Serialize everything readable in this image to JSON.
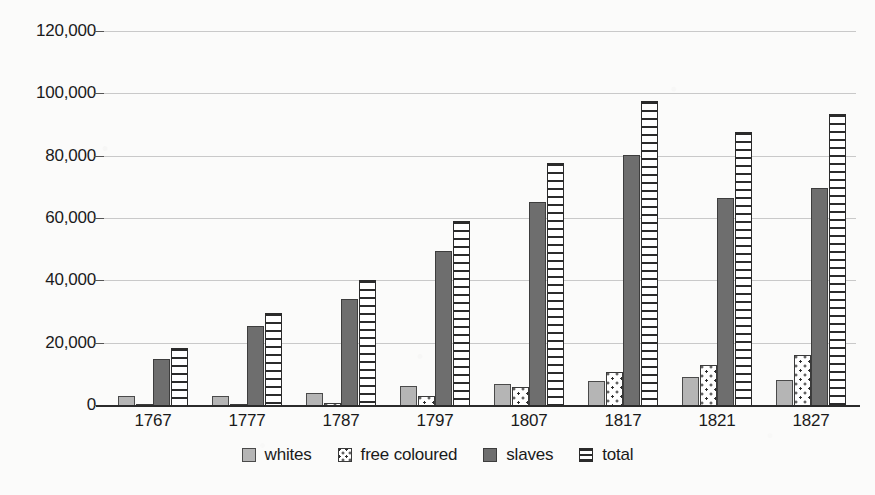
{
  "chart_data": {
    "type": "bar",
    "title": "",
    "subtitle": "",
    "xlabel": "",
    "ylabel": "",
    "ylim": [
      0,
      120000
    ],
    "yticks": [
      0,
      20000,
      40000,
      60000,
      80000,
      100000,
      120000
    ],
    "ytick_labels": [
      "0",
      "20,000",
      "40,000",
      "60,000",
      "80,000",
      "100,000",
      "120,000"
    ],
    "grid": true,
    "legend_position": "bottom",
    "categories": [
      "1767",
      "1777",
      "1787",
      "1797",
      "1807",
      "1817",
      "1821",
      "1827"
    ],
    "series": [
      {
        "name": "whites",
        "pattern": "solid-light-gray",
        "color": "#b5b5b5",
        "values": [
          3100,
          3300,
          4300,
          6500,
          7000,
          8000,
          9200,
          8400
        ]
      },
      {
        "name": "free coloured",
        "pattern": "white-dotted",
        "color": "#ffffff",
        "values": [
          500,
          800,
          1100,
          3300,
          6000,
          11000,
          13300,
          16300
        ]
      },
      {
        "name": "slaves",
        "pattern": "solid-dark-gray",
        "color": "#6e6e6e",
        "values": [
          15000,
          25600,
          34200,
          49600,
          65600,
          80400,
          66600,
          69800
        ]
      },
      {
        "name": "total",
        "pattern": "white-horizontal-stripes",
        "color": "#ffffff",
        "values": [
          18600,
          29700,
          40500,
          59400,
          78000,
          98000,
          88000,
          93600
        ]
      }
    ]
  },
  "legend": {
    "items": [
      {
        "label": "whites",
        "swatch": "swatch-whites"
      },
      {
        "label": "free coloured",
        "swatch": "swatch-free-coloured"
      },
      {
        "label": "slaves",
        "swatch": "swatch-slaves"
      },
      {
        "label": "total",
        "swatch": "swatch-total"
      }
    ]
  },
  "colors": {
    "background": "#fbfbfa",
    "axis": "#2b2b2b",
    "gridline": "#c9c9c9",
    "text": "#1a1a1a"
  }
}
